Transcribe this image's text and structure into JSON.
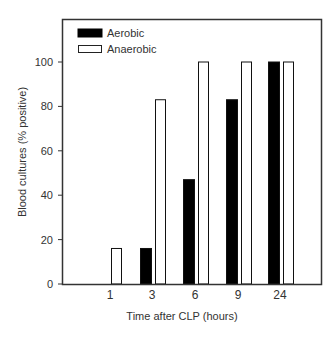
{
  "chart_data": {
    "type": "bar",
    "title": "",
    "xlabel": "Time after CLP (hours)",
    "ylabel": "Blood cultures (% positive)",
    "categories": [
      "1",
      "3",
      "6",
      "9",
      "24"
    ],
    "series": [
      {
        "name": "Aerobic",
        "fill": "#000000",
        "values": [
          0,
          16,
          47,
          83,
          100
        ]
      },
      {
        "name": "Anaerobic",
        "fill": "#ffffff",
        "values": [
          16,
          83,
          100,
          100,
          100
        ]
      }
    ],
    "ylim": [
      0,
      120
    ],
    "yticks": [
      0,
      20,
      40,
      60,
      80,
      100
    ],
    "grid": false,
    "legend_position": "upper-left"
  },
  "colors": {
    "frame": "#333333",
    "text": "#333333",
    "background": "#ffffff"
  }
}
